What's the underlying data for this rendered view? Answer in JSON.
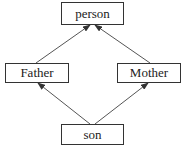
{
  "diagram": {
    "type": "inheritance-graph",
    "nodes": [
      {
        "id": "person",
        "label": "person"
      },
      {
        "id": "father",
        "label": "Father"
      },
      {
        "id": "mother",
        "label": "Mother"
      },
      {
        "id": "son",
        "label": "son"
      }
    ],
    "edges": [
      {
        "from": "Father",
        "to": "person"
      },
      {
        "from": "Mother",
        "to": "person"
      },
      {
        "from": "son",
        "to": "Father"
      },
      {
        "from": "son",
        "to": "Mother"
      }
    ],
    "colors": {
      "line": "#333333",
      "text": "#222222",
      "background": "#ffffff"
    }
  }
}
